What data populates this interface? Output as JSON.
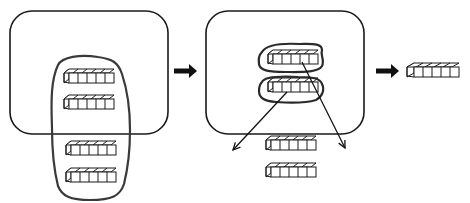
{
  "diagram": {
    "colors": {
      "stroke": "#1a1a1a",
      "fill": "#ffffff",
      "arrow": "#111111"
    },
    "panels": [
      {
        "id": "panel-1",
        "label": "",
        "box": {
          "x": 10,
          "y": 11,
          "w": 158,
          "h": 123,
          "r": 22
        },
        "bars": [
          {
            "x": 64,
            "y": 73,
            "cells": 5
          },
          {
            "x": 64,
            "y": 99,
            "cells": 5
          },
          {
            "x": 66,
            "y": 145,
            "cells": 5
          },
          {
            "x": 66,
            "y": 172,
            "cells": 5
          }
        ]
      },
      {
        "id": "panel-2",
        "label": "",
        "box": {
          "x": 206,
          "y": 11,
          "w": 158,
          "h": 123,
          "r": 22
        },
        "bars_inside": [
          {
            "x": 268,
            "y": 54,
            "cells": 5
          },
          {
            "x": 268,
            "y": 82,
            "cells": 5
          }
        ],
        "bars_outside": [
          {
            "x": 266,
            "y": 140,
            "cells": 5
          },
          {
            "x": 266,
            "y": 167,
            "cells": 5
          }
        ]
      },
      {
        "id": "panel-3",
        "label": "",
        "bars": [
          {
            "x": 407,
            "y": 67,
            "cells": 5
          }
        ]
      }
    ],
    "arrows": [
      {
        "id": "arrow-1",
        "type": "block",
        "x1": 174,
        "y1": 71,
        "x2": 197,
        "y2": 71
      },
      {
        "id": "arrow-2",
        "type": "block",
        "x1": 376,
        "y1": 71,
        "x2": 399,
        "y2": 71
      },
      {
        "id": "arrow-split-left",
        "type": "line",
        "x1": 287,
        "y1": 92,
        "x2": 233,
        "y2": 150
      },
      {
        "id": "arrow-split-right",
        "type": "line",
        "x1": 302,
        "y1": 62,
        "x2": 345,
        "y2": 148
      }
    ],
    "cell_size": 9,
    "cube_depth": 5
  }
}
